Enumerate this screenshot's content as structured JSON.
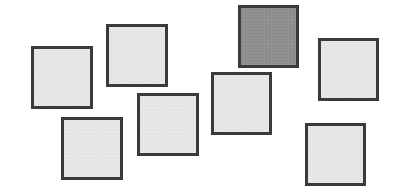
{
  "diagram": {
    "colors": {
      "background": "#ffffff",
      "border": "#3a3a3a",
      "light_fill": "#e6e6e6",
      "dark_fill": "#8f8f8f"
    },
    "squares": [
      {
        "id": "A",
        "x": 31,
        "y": 46,
        "w": 62,
        "h": 63,
        "shade": "light"
      },
      {
        "id": "B",
        "x": 106,
        "y": 24,
        "w": 62,
        "h": 63,
        "shade": "light"
      },
      {
        "id": "C",
        "x": 61,
        "y": 117,
        "w": 62,
        "h": 63,
        "shade": "light"
      },
      {
        "id": "D",
        "x": 137,
        "y": 93,
        "w": 62,
        "h": 63,
        "shade": "light"
      },
      {
        "id": "E",
        "x": 211,
        "y": 72,
        "w": 61,
        "h": 63,
        "shade": "light"
      },
      {
        "id": "F",
        "x": 238,
        "y": 5,
        "w": 61,
        "h": 63,
        "shade": "dark"
      },
      {
        "id": "G",
        "x": 318,
        "y": 38,
        "w": 61,
        "h": 63,
        "shade": "light"
      },
      {
        "id": "H",
        "x": 305,
        "y": 123,
        "w": 61,
        "h": 63,
        "shade": "light"
      }
    ]
  }
}
